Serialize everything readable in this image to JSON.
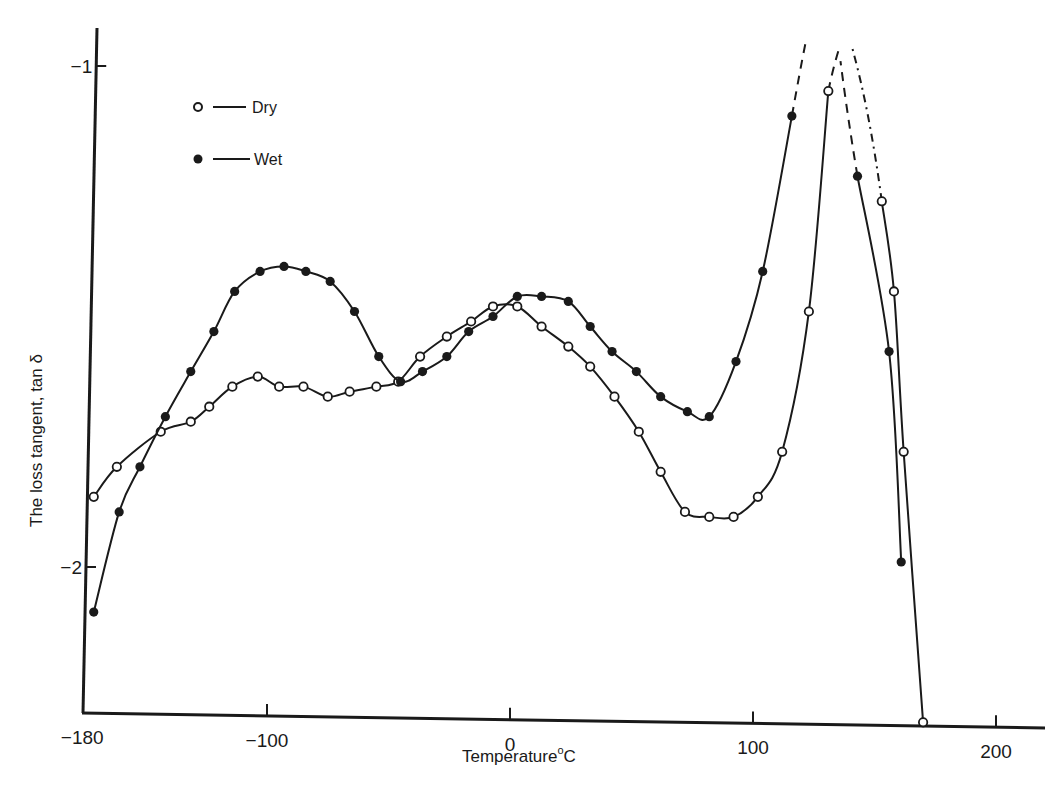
{
  "chart_data": {
    "type": "line",
    "title": "",
    "xlabel": "Temperature °C",
    "ylabel": "The loss tangent, tan δ",
    "xlim": [
      -185,
      225
    ],
    "ylim": [
      -2.31,
      -0.91
    ],
    "y_inverted_log_labels": true,
    "x_ticks": [
      -180,
      -100,
      0,
      100,
      200
    ],
    "x_tick_labels": [
      "−180",
      "−100",
      "0",
      "100",
      "200"
    ],
    "y_ticks": [
      -1,
      -2
    ],
    "y_tick_labels": [
      "−1",
      "−2"
    ],
    "grid": false,
    "legend_position": "upper-left",
    "series": [
      {
        "name": "Dry",
        "marker": "open-circle",
        "x": [
          -175,
          -165,
          -146,
          -133,
          -125,
          -115,
          -104,
          -95,
          -85,
          -75,
          -66,
          -55,
          -46,
          -37,
          -26,
          -16,
          -7,
          3,
          13,
          24,
          33,
          43,
          53,
          62,
          72,
          82,
          92,
          102,
          112,
          123,
          131,
          153,
          158,
          162,
          170
        ],
        "y": [
          -1.86,
          -1.8,
          -1.73,
          -1.71,
          -1.68,
          -1.64,
          -1.62,
          -1.64,
          -1.64,
          -1.66,
          -1.65,
          -1.64,
          -1.63,
          -1.58,
          -1.54,
          -1.51,
          -1.48,
          -1.48,
          -1.52,
          -1.56,
          -1.6,
          -1.66,
          -1.73,
          -1.81,
          -1.89,
          -1.9,
          -1.9,
          -1.86,
          -1.77,
          -1.49,
          -1.05,
          -1.27,
          -1.45,
          -1.77,
          -2.31
        ],
        "extrapolated_dashed": true
      },
      {
        "name": "Wet",
        "marker": "filled-circle",
        "x": [
          -175,
          -164,
          -155,
          -144,
          -133,
          -123,
          -114,
          -103,
          -93,
          -84,
          -74,
          -64,
          -54,
          -45,
          -36,
          -26,
          -17,
          -7,
          3,
          13,
          24,
          33,
          42,
          52,
          62,
          73,
          82,
          93,
          104,
          116,
          143,
          156,
          161
        ],
        "y": [
          -2.09,
          -1.89,
          -1.8,
          -1.7,
          -1.61,
          -1.53,
          -1.45,
          -1.41,
          -1.4,
          -1.41,
          -1.43,
          -1.49,
          -1.58,
          -1.63,
          -1.61,
          -1.58,
          -1.53,
          -1.5,
          -1.46,
          -1.46,
          -1.47,
          -1.52,
          -1.57,
          -1.61,
          -1.66,
          -1.69,
          -1.7,
          -1.59,
          -1.41,
          -1.1,
          -1.22,
          -1.57,
          -1.99
        ],
        "extrapolated_dashed": true
      }
    ]
  },
  "legend": {
    "items": [
      {
        "label": "Dry",
        "marker": "open-circle"
      },
      {
        "label": "Wet",
        "marker": "filled-circle"
      }
    ]
  },
  "axes": {
    "x_title": "Temperature",
    "x_unit_degree": "o",
    "x_unit": "C",
    "y_title": "The loss tangent, tan δ"
  },
  "colors": {
    "ink": "#1a1a1a",
    "background": "#ffffff"
  }
}
